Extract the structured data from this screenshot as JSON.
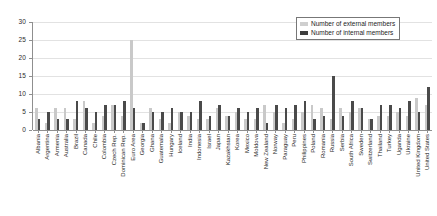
{
  "chart_data": {
    "type": "bar",
    "title": "",
    "xlabel": "",
    "ylabel": "",
    "ylim": [
      0,
      30
    ],
    "ytick_values": [
      0,
      5,
      10,
      15,
      20,
      25,
      30
    ],
    "ytick_labels": [
      "0",
      "5",
      "10",
      "15",
      "20",
      "25",
      "30"
    ],
    "grid": true,
    "legend_position": "top-right",
    "orientation": "vertical",
    "bar_mode": "grouped",
    "colors": {
      "external": "#c9c9c9",
      "internal": "#4a4a4a",
      "gridline": "#e2e2e2",
      "axis": "#8f8f8f",
      "text": "#1f1f1f",
      "background": "#ffffff"
    },
    "categories": [
      "Albania",
      "Argentina",
      "Armenia",
      "Australia",
      "Brazil",
      "Canada",
      "Chile",
      "Colombia",
      "Czech Rep.",
      "Dominican Rep.",
      "Euro Area",
      "Georgia",
      "Ghana",
      "Guatemala",
      "Hungary",
      "Iceland",
      "India",
      "Indonesia",
      "Israel",
      "Japan",
      "Kazakhstan",
      "Korea",
      "Mexico",
      "Moldova",
      "New Zealand",
      "Norway",
      "Paraguay",
      "Peru",
      "Philippines",
      "Poland",
      "Romania",
      "Russia",
      "Serbia",
      "South Africa",
      "Sweden",
      "Switzerland",
      "Thailand",
      "Turkey",
      "Uganda",
      "Ukraine",
      "United Kingdom",
      "United States"
    ],
    "series": [
      {
        "name": "Number of external members",
        "color": "#c9c9c9",
        "values": [
          6,
          2,
          6,
          6,
          3,
          8,
          2,
          4,
          7,
          4,
          25,
          2,
          6,
          3,
          2,
          5,
          4,
          3,
          3,
          6,
          4,
          5,
          3,
          3,
          7,
          5,
          2,
          3,
          5,
          7,
          6,
          3,
          6,
          5,
          6,
          3,
          4,
          4,
          5,
          4,
          9,
          7
        ]
      },
      {
        "name": "Number of internal members",
        "color": "#4a4a4a",
        "values": [
          3,
          5,
          3,
          3,
          8,
          6,
          5,
          7,
          7,
          8,
          6,
          2,
          5,
          5,
          6,
          5,
          5,
          8,
          4,
          7,
          4,
          6,
          5,
          6,
          2,
          7,
          6,
          7,
          8,
          3,
          4,
          15,
          4,
          8,
          6,
          3,
          7,
          7,
          6,
          8,
          5,
          12
        ]
      }
    ]
  },
  "legend": {
    "items": [
      {
        "label": "Number of external members",
        "swatch": "external"
      },
      {
        "label": "Number of internal members",
        "swatch": "internal"
      }
    ]
  }
}
